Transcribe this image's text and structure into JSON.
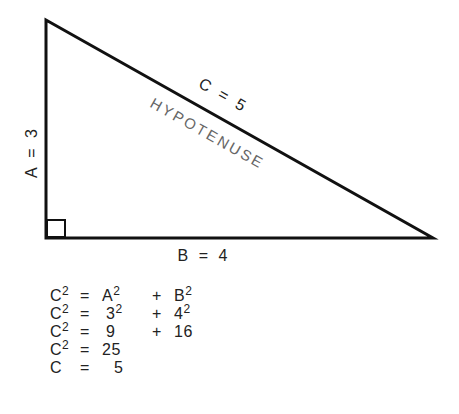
{
  "diagram": {
    "type": "right-triangle",
    "vertices": {
      "top": [
        46,
        20
      ],
      "right_angle": [
        46,
        238
      ],
      "right": [
        433,
        238
      ]
    },
    "labels": {
      "side_a": "A = 3",
      "side_b": "B = 4",
      "side_c": "C = 5",
      "hypotenuse": "HYPOTENUSE"
    },
    "colors": {
      "line": "#111111",
      "hypotenuse_text": "#666666",
      "text": "#222222"
    }
  },
  "equations": [
    {
      "lhs": "C",
      "lhs_sup": "2",
      "eq": "=",
      "t1": "A",
      "t1_sup": "2",
      "op": "+",
      "t2": "B",
      "t2_sup": "2"
    },
    {
      "lhs": "C",
      "lhs_sup": "2",
      "eq": "=",
      "t1": "3",
      "t1_sup": "2",
      "op": "+",
      "t2": "4",
      "t2_sup": "2"
    },
    {
      "lhs": "C",
      "lhs_sup": "2",
      "eq": "=",
      "t1": "9",
      "t1_sup": "",
      "op": "+",
      "t2": "16",
      "t2_sup": ""
    },
    {
      "lhs": "C",
      "lhs_sup": "2",
      "eq": "=",
      "t1": "25",
      "t1_sup": "",
      "op": "",
      "t2": "",
      "t2_sup": ""
    },
    {
      "lhs": "C",
      "lhs_sup": "",
      "eq": "=",
      "t1": "5",
      "t1_sup": "",
      "op": "",
      "t2": "",
      "t2_sup": ""
    }
  ]
}
